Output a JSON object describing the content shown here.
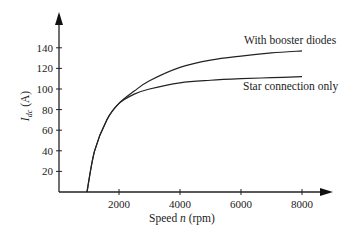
{
  "chart_data": {
    "type": "line",
    "title": "",
    "xlabel": "Speed n (rpm)",
    "ylabel": "I_dc (A)",
    "ylabel_main": "I",
    "ylabel_sub": "dc",
    "ylabel_unit": " (A)",
    "xlabel_prefix": "Speed ",
    "xlabel_var": "n",
    "xlabel_unit": " (rpm)",
    "xlim": [
      0,
      8800
    ],
    "ylim": [
      0,
      160
    ],
    "xticks": [
      2000,
      4000,
      6000,
      8000
    ],
    "yticks": [
      20,
      40,
      60,
      80,
      100,
      120,
      140
    ],
    "grid": false,
    "legend": "inline labels at curve ends",
    "series": [
      {
        "name": "With booster diodes",
        "x": [
          950,
          1200,
          1600,
          2000,
          2500,
          3000,
          4000,
          5000,
          6000,
          7000,
          8000
        ],
        "values": [
          0,
          40,
          70,
          86,
          98,
          108,
          121,
          128,
          132,
          135,
          137
        ]
      },
      {
        "name": "Star connection only",
        "x": [
          950,
          1200,
          1600,
          2000,
          2500,
          3000,
          4000,
          5000,
          6000,
          7000,
          8000
        ],
        "values": [
          0,
          40,
          70,
          86,
          95,
          100,
          106,
          108.5,
          110,
          111,
          112
        ]
      }
    ]
  }
}
